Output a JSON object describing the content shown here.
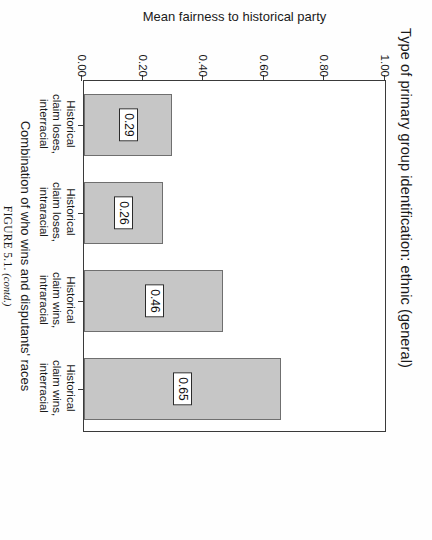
{
  "figure": {
    "caption_label": "FIGURE 5.1.",
    "caption_note": "(contd.)"
  },
  "chart_data": {
    "type": "bar",
    "title": "Type of primary group identification: ethnic (general)",
    "xlabel": "Combination of who wins and disputants' races",
    "ylabel": "Mean fairness to historical party",
    "orientation": "vertical",
    "grid": false,
    "legend": null,
    "ylim": [
      0.0,
      1.0
    ],
    "ytick_labels": [
      "0.00",
      "0.20",
      "0.40",
      "0.60",
      "0.80",
      "1.00"
    ],
    "ytick_values": [
      0.0,
      0.2,
      0.4,
      0.6,
      0.8,
      1.0
    ],
    "categories": [
      "Historical claim loses, interracial",
      "Historical claim loses, intraracial",
      "Historical claim wins, intraracial",
      "Historical claim wins, interracial"
    ],
    "category_label_lines": [
      [
        "Historical",
        "claim loses,",
        "interracial"
      ],
      [
        "Historical",
        "claim loses,",
        "intraracial"
      ],
      [
        "Historical",
        "claim wins,",
        "intraracial"
      ],
      [
        "Historical",
        "claim wins,",
        "interracial"
      ]
    ],
    "values": [
      0.29,
      0.26,
      0.46,
      0.65
    ],
    "value_labels": [
      "0.29",
      "0.26",
      "0.46",
      "0.65"
    ],
    "bar_fill_color": "#c6c6c6",
    "bar_edge_color": "#6f6f6f"
  }
}
